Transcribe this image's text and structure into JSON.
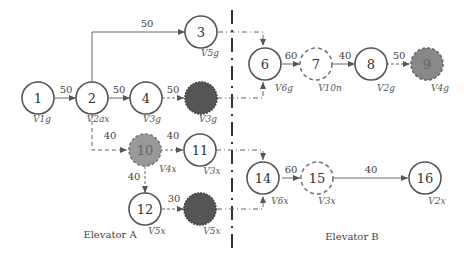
{
  "diagram": {
    "nodes": [
      {
        "id": "1",
        "label": "1",
        "v": "V1g",
        "style": "solid"
      },
      {
        "id": "2",
        "label": "2",
        "v": "V2ax",
        "style": "solid"
      },
      {
        "id": "3",
        "label": "3",
        "v": "V5g",
        "style": "solid"
      },
      {
        "id": "4",
        "label": "4",
        "v": "V3g",
        "style": "solid"
      },
      {
        "id": "5",
        "label": "",
        "v": "V3g",
        "style": "filled-dark"
      },
      {
        "id": "6",
        "label": "6",
        "v": "V6g",
        "style": "solid"
      },
      {
        "id": "7",
        "label": "7",
        "v": "V10n",
        "style": "dashed"
      },
      {
        "id": "8",
        "label": "8",
        "v": "V2g",
        "style": "solid"
      },
      {
        "id": "9",
        "label": "9",
        "v": "V4g",
        "style": "filled-gray"
      },
      {
        "id": "10",
        "label": "10",
        "v": "V4x",
        "style": "filled-gray"
      },
      {
        "id": "11",
        "label": "11",
        "v": "V3x",
        "style": "solid"
      },
      {
        "id": "12",
        "label": "12",
        "v": "V5x",
        "style": "solid"
      },
      {
        "id": "13",
        "label": "",
        "v": "V5x",
        "style": "filled-dark"
      },
      {
        "id": "14",
        "label": "14",
        "v": "V6x",
        "style": "solid"
      },
      {
        "id": "15",
        "label": "15",
        "v": "V3x",
        "style": "dashed"
      },
      {
        "id": "16",
        "label": "16",
        "v": "V2x",
        "style": "solid"
      }
    ],
    "edges": [
      {
        "from": "1",
        "to": "2",
        "weight": "50"
      },
      {
        "from": "2",
        "to": "3",
        "weight": "50"
      },
      {
        "from": "2",
        "to": "4",
        "weight": "50"
      },
      {
        "from": "4",
        "to": "5",
        "weight": "50"
      },
      {
        "from": "2",
        "to": "10",
        "weight": "40"
      },
      {
        "from": "10",
        "to": "11",
        "weight": "40"
      },
      {
        "from": "10",
        "to": "12",
        "weight": "40"
      },
      {
        "from": "12",
        "to": "13",
        "weight": "30"
      },
      {
        "from": "6",
        "to": "7",
        "weight": "60"
      },
      {
        "from": "7",
        "to": "8",
        "weight": "40"
      },
      {
        "from": "8",
        "to": "9",
        "weight": "50"
      },
      {
        "from": "14",
        "to": "15",
        "weight": "60"
      },
      {
        "from": "15",
        "to": "16",
        "weight": "40"
      }
    ],
    "elevator_a": "Elevator A",
    "elevator_b": "Elevator B"
  }
}
